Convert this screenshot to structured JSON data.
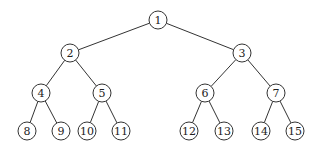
{
  "diagram": {
    "type": "binary-tree",
    "colors": {
      "stroke": "#333333",
      "fill": "#ffffff",
      "text": "#222222"
    },
    "node_radius": 9,
    "nodes": [
      {
        "id": 1,
        "label": "1",
        "x": 158,
        "y": 20
      },
      {
        "id": 2,
        "label": "2",
        "x": 70,
        "y": 53
      },
      {
        "id": 3,
        "label": "3",
        "x": 242,
        "y": 53
      },
      {
        "id": 4,
        "label": "4",
        "x": 41,
        "y": 93
      },
      {
        "id": 5,
        "label": "5",
        "x": 102,
        "y": 93
      },
      {
        "id": 6,
        "label": "6",
        "x": 205,
        "y": 93
      },
      {
        "id": 7,
        "label": "7",
        "x": 276,
        "y": 93
      },
      {
        "id": 8,
        "label": "8",
        "x": 27,
        "y": 131
      },
      {
        "id": 9,
        "label": "9",
        "x": 61,
        "y": 131
      },
      {
        "id": 10,
        "label": "10",
        "x": 87,
        "y": 131
      },
      {
        "id": 11,
        "label": "11",
        "x": 121,
        "y": 131
      },
      {
        "id": 12,
        "label": "12",
        "x": 189,
        "y": 131
      },
      {
        "id": 13,
        "label": "13",
        "x": 224,
        "y": 131
      },
      {
        "id": 14,
        "label": "14",
        "x": 261,
        "y": 131
      },
      {
        "id": 15,
        "label": "15",
        "x": 295,
        "y": 131
      }
    ],
    "edges": [
      [
        1,
        2
      ],
      [
        1,
        3
      ],
      [
        2,
        4
      ],
      [
        2,
        5
      ],
      [
        3,
        6
      ],
      [
        3,
        7
      ],
      [
        4,
        8
      ],
      [
        4,
        9
      ],
      [
        5,
        10
      ],
      [
        5,
        11
      ],
      [
        6,
        12
      ],
      [
        6,
        13
      ],
      [
        7,
        14
      ],
      [
        7,
        15
      ]
    ]
  }
}
